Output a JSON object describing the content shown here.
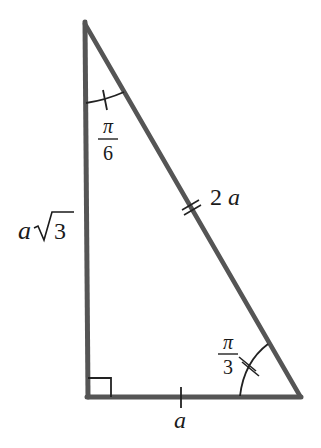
{
  "diagram": {
    "type": "right-triangle",
    "colors": {
      "stroke": "#555555",
      "text": "#1a1a1a"
    },
    "vertices": {
      "top": [
        84,
        22
      ],
      "bottom_left": [
        88,
        396
      ],
      "bottom_right": [
        301,
        396
      ]
    },
    "sides": {
      "vertical": {
        "label_coef": "a",
        "label_radical": "3",
        "full": "a√3"
      },
      "hypotenuse": {
        "label": "2a",
        "tick_marks": 2
      },
      "base": {
        "label": "a",
        "tick_marks": 1
      }
    },
    "angles": {
      "top": {
        "num": "π",
        "den": "6",
        "full": "π/6",
        "tick_marks": 1
      },
      "bottom_right": {
        "num": "π",
        "den": "3",
        "full": "π/3",
        "tick_marks": 2
      },
      "bottom_left": {
        "right_angle": true
      }
    }
  }
}
